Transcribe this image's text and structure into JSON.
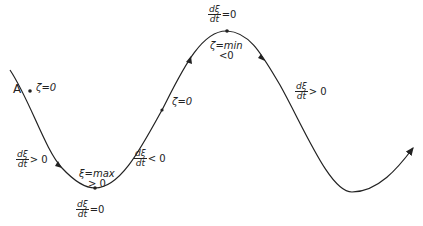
{
  "diagram": {
    "type": "oscillation-curve",
    "stroke_color": "#222222",
    "point_label": "A",
    "labels": {
      "zeta_zero_A": "ζ=0",
      "rate_pos_left": {
        "num": "dξ",
        "den": "dt",
        "rel": "> 0"
      },
      "max": {
        "line1": "ξ=max",
        "line2": "> 0"
      },
      "rate_zero_bottom": {
        "num": "dξ",
        "den": "dt",
        "rel": "=0"
      },
      "rate_neg": {
        "num": "dξ",
        "den": "dt",
        "rel": "< 0"
      },
      "zeta_zero_mid": "ζ=0",
      "rate_zero_top": {
        "num": "dξ",
        "den": "dt",
        "rel": "=0"
      },
      "min": {
        "line1": "ζ=min",
        "line2": "<0"
      },
      "rate_pos_right": {
        "num": "dξ",
        "den": "dt",
        "rel": "> 0"
      }
    }
  }
}
